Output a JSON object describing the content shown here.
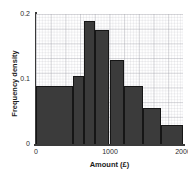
{
  "top_clipped_text": "",
  "chart_data": {
    "type": "bar",
    "title": "",
    "subtitle": "",
    "xlabel": "Amount (£)",
    "ylabel": "Frequency density",
    "xlim": [
      0,
      2000
    ],
    "ylim": [
      0,
      0.2
    ],
    "xticks": [
      "0",
      "1000",
      "2000"
    ],
    "xtick_values": [
      0,
      1000,
      2000
    ],
    "yticks": [
      "0",
      "0.1",
      "0.2"
    ],
    "ytick_values": [
      0,
      0.1,
      0.2
    ],
    "grid": true,
    "grid_style": "graph-paper-minor-and-major",
    "legend": null,
    "bar_color": "#3b3b3b",
    "bar_edge_color": "#161616",
    "bin_edges": [
      0,
      250,
      500,
      650,
      800,
      1000,
      1200,
      1450,
      1700,
      2000
    ],
    "categories": [
      "0-250",
      "250-500",
      "500-650",
      "650-800",
      "800-1000",
      "1000-1200",
      "1200-1450",
      "1450-1700",
      "1700-2000"
    ],
    "values": [
      0.09,
      0.09,
      0.105,
      0.19,
      0.175,
      0.13,
      0.09,
      0.055,
      0.03
    ],
    "series": [
      {
        "name": "Frequency density",
        "values": [
          0.09,
          0.09,
          0.105,
          0.19,
          0.175,
          0.13,
          0.09,
          0.055,
          0.03
        ]
      }
    ],
    "bars": [
      {
        "label": "0-500",
        "x_start": 0,
        "x_end": 500,
        "value": 0.09
      },
      {
        "label": "500-650",
        "x_start": 500,
        "x_end": 650,
        "value": 0.105
      },
      {
        "label": "650-800",
        "x_start": 650,
        "x_end": 800,
        "value": 0.19
      },
      {
        "label": "800-1000",
        "x_start": 800,
        "x_end": 1000,
        "value": 0.175
      },
      {
        "label": "1000-1200",
        "x_start": 1000,
        "x_end": 1200,
        "value": 0.13
      },
      {
        "label": "1200-1450",
        "x_start": 1200,
        "x_end": 1450,
        "value": 0.09
      },
      {
        "label": "1450-1700",
        "x_start": 1450,
        "x_end": 1700,
        "value": 0.055
      },
      {
        "label": "1700-2000",
        "x_start": 1700,
        "x_end": 2000,
        "value": 0.03
      }
    ]
  }
}
